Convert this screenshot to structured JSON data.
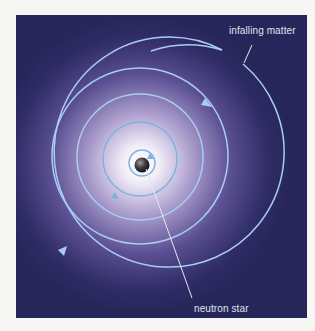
{
  "diagram": {
    "labels": {
      "infalling_matter": "infalling matter",
      "neutron_star": "neutron star"
    },
    "colors": {
      "background": "#27265a",
      "glow_center": "#ffffff",
      "spiral": "#9cc4ea",
      "page": "#f6f6f4"
    }
  }
}
